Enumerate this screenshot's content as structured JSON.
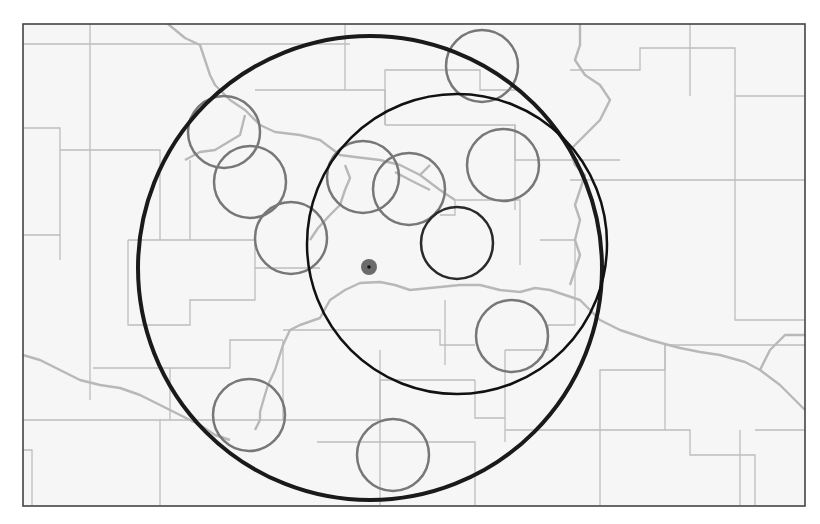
{
  "map": {
    "frame": {
      "x": 23,
      "y": 24,
      "w": 782,
      "h": 482,
      "stroke": "#444444"
    },
    "background": "#f6f6f6",
    "county_line_color": "#bdbdbd",
    "river_color": "#b8b8b8",
    "county_lines": [
      "M23 44 L350 44",
      "M90 24 L90 44",
      "M90 44 L90 400",
      "M23 128 L60 128 L60 260",
      "M60 150 L160 150 L160 240",
      "M160 150 L160 150",
      "M128 240 L128 325 L190 325 L190 300 L255 300 L255 268",
      "M128 240 L255 240 L255 268 L320 268",
      "M190 160 L190 240",
      "M255 90 L385 90 L385 125",
      "M345 24 L345 90",
      "M385 125 L385 70 L480 70 L480 90 L520 90",
      "M385 125 L515 125 L515 160 L620 160",
      "M515 125 L515 210",
      "M455 200 L520 200 L520 265",
      "M455 200 L455 215 L440 215",
      "M570 70 L640 70 L640 48 L735 48 L735 320 L805 320",
      "M735 96 L805 96",
      "M570 180 L805 180",
      "M690 24 L690 96",
      "M23 235 L60 235",
      "M283 330 L440 330 L440 345 L475 345",
      "M93 368 L230 368 L230 340 L283 340",
      "M170 368 L170 420",
      "M23 420 L160 420 L160 505",
      "M23 450 L32 450 L32 505",
      "M160 420 L380 420 L380 505",
      "M283 340 L283 420",
      "M380 350 L380 420",
      "M380 420 L380 380 L475 380",
      "M317 442 L475 442 L475 505",
      "M475 380 L475 418 L505 418",
      "M505 350 L505 442",
      "M505 430 L600 430 L600 505",
      "M600 430 L690 430 L690 455 L755 455 L755 505",
      "M600 430 L600 370 L665 370 L665 345 L805 345",
      "M665 345 L665 430",
      "M755 430 L805 430",
      "M740 430 L740 505",
      "M505 350 L548 350 L548 325 L575 325",
      "M445 300 L445 365",
      "M540 240 L575 240 L575 325"
    ],
    "rivers": [
      "M168 24 L185 38 L200 45 L205 60 L210 75 L215 85 L230 100 L245 110 L260 125 L275 132 L300 135 L320 140 L340 155 L355 157 L380 160 L400 165 L420 175 L440 190 L455 200",
      "M245 115 L240 135 L215 150 L200 152 L185 160",
      "M345 165 L350 178 L345 190 L340 205 L330 215 L318 228 L310 240",
      "M395 172 L410 180 L430 190",
      "M430 165 L420 175",
      "M283 345 L290 330 L300 325 L320 318 L330 300 L345 290 L360 283 L380 282 L395 285 L410 290 L430 288 L460 285 L480 285 L500 290 L520 292 L535 288 L550 290 L565 295 L580 300 L600 320 L620 330 L650 340 L680 348 L700 352 L720 355 L745 362 L760 370 L780 385 L795 400 L805 410",
      "M283 345 L275 370 L268 385 L264 398 L260 412 L260 420 L255 430",
      "M23 355 L40 360 L60 370 L80 380 L100 385 L120 388 L140 395 L160 405 L180 415 L200 425 L215 435 L230 440",
      "M580 24 L580 45 L575 60 L585 75 L600 85 L610 100 L605 110 L600 120 L590 130 L580 140 L570 150 L575 165 L585 175 L580 190 L575 205 L580 220 L575 240 L580 255 L575 270 L570 285",
      "M760 370 L770 350 L785 335 L805 335"
    ],
    "range_rings": [
      {
        "name": "outer-range-ring",
        "cx": 370,
        "cy": 268,
        "r": 232,
        "stroke": "#1a1a1a",
        "width": 4
      },
      {
        "name": "inner-range-ring",
        "cx": 457,
        "cy": 244,
        "r": 150,
        "stroke": "#111111",
        "width": 2.5
      }
    ],
    "focus_site": {
      "cx": 457,
      "cy": 243,
      "r": 36,
      "stroke": "#2a2a2a",
      "width": 2.5
    },
    "sites": [
      {
        "cx": 482,
        "cy": 66,
        "r": 36
      },
      {
        "cx": 224,
        "cy": 132,
        "r": 36
      },
      {
        "cx": 250,
        "cy": 182,
        "r": 36
      },
      {
        "cx": 291,
        "cy": 238,
        "r": 36
      },
      {
        "cx": 363,
        "cy": 177,
        "r": 36
      },
      {
        "cx": 409,
        "cy": 189,
        "r": 36
      },
      {
        "cx": 503,
        "cy": 165,
        "r": 36
      },
      {
        "cx": 512,
        "cy": 336,
        "r": 36
      },
      {
        "cx": 249,
        "cy": 415,
        "r": 36
      },
      {
        "cx": 393,
        "cy": 455,
        "r": 36
      }
    ],
    "site_stroke": "#777777",
    "site_stroke_width": 2.5,
    "center_marker": {
      "cx": 369,
      "cy": 267,
      "r": 8,
      "fill": "#6b6b6b",
      "dot_fill": "#111111"
    }
  }
}
